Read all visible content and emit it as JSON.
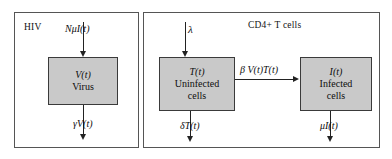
{
  "figure": {
    "type": "compartmental-flow-diagram",
    "panels": [
      {
        "id": "hiv",
        "title": "HIV",
        "compartments": [
          {
            "id": "virus",
            "state": "V(t)",
            "name": "Virus"
          }
        ]
      },
      {
        "id": "tcells",
        "title": "CD4+ T cells",
        "compartments": [
          {
            "id": "uninfected",
            "state": "T(t)",
            "name": "Uninfected cells",
            "name_line1": "Uninfected",
            "name_line2": "cells"
          },
          {
            "id": "infected",
            "state": "I(t)",
            "name": "Infected cells",
            "name_line1": "Infected",
            "name_line2": "cells"
          }
        ]
      }
    ],
    "flows": [
      {
        "id": "virus-production",
        "label": "NμI(t)",
        "direction": "down",
        "target": "virus"
      },
      {
        "id": "virus-clearance",
        "label": "γV(t)",
        "direction": "down",
        "source": "virus"
      },
      {
        "id": "tcell-source",
        "label": "λ",
        "direction": "down",
        "target": "uninfected"
      },
      {
        "id": "infection",
        "label": "β V(t)T(t)",
        "direction": "right",
        "source": "uninfected",
        "target": "infected"
      },
      {
        "id": "uninfected-death",
        "label": "δT(t)",
        "direction": "down",
        "source": "uninfected"
      },
      {
        "id": "infected-death",
        "label": "μI(t)",
        "direction": "down",
        "source": "infected"
      }
    ],
    "colors": {
      "compartment_fill": "#c9c9c9",
      "compartment_stroke": "#3a3a3a",
      "panel_stroke": "#555555",
      "arrow": "#222222",
      "background": "#ffffff",
      "text": "#0d0d0d"
    }
  }
}
